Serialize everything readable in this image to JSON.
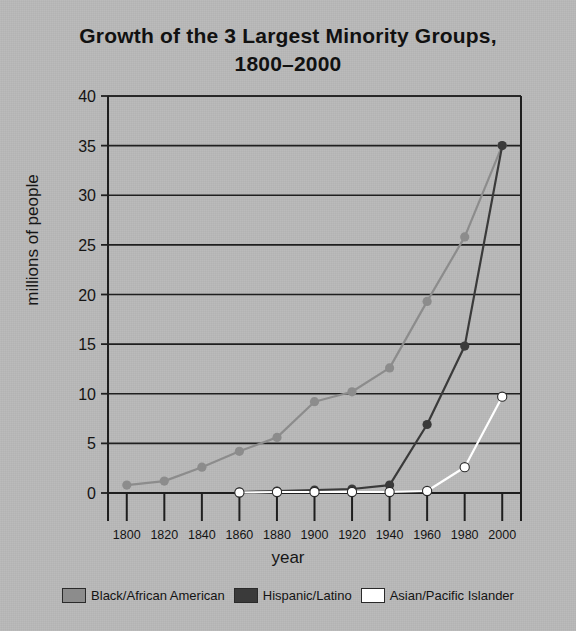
{
  "title": {
    "line1": "Growth of the 3 Largest Minority Groups,",
    "line2": "1800–2000"
  },
  "axes": {
    "xlabel": "year",
    "ylabel": "millions of people"
  },
  "legend": {
    "items": [
      {
        "label": "Black/African American",
        "color": "#8c8c8c"
      },
      {
        "label": "Hispanic/Latino",
        "color": "#3a3a3a"
      },
      {
        "label": "Asian/Pacific Islander",
        "color": "#ffffff"
      }
    ]
  },
  "chart_data": {
    "type": "line",
    "title": "Growth of the 3 Largest Minority Groups, 1800–2000",
    "xlabel": "year",
    "ylabel": "millions of people",
    "x": [
      1800,
      1820,
      1840,
      1860,
      1880,
      1900,
      1920,
      1940,
      1960,
      1980,
      2000
    ],
    "xlim": [
      1790,
      2010
    ],
    "ylim": [
      0,
      40
    ],
    "yticks": [
      0,
      5,
      10,
      15,
      20,
      25,
      30,
      35,
      40
    ],
    "xticks": [
      1800,
      1820,
      1840,
      1860,
      1880,
      1900,
      1920,
      1940,
      1960,
      1980,
      2000
    ],
    "grid": "horizontal",
    "legend_position": "bottom",
    "series": [
      {
        "name": "Black/African American",
        "color": "#8c8c8c",
        "x": [
          1800,
          1820,
          1840,
          1860,
          1880,
          1900,
          1920,
          1940,
          1960,
          1980,
          2000
        ],
        "values": [
          0.8,
          1.2,
          2.6,
          4.2,
          5.6,
          9.2,
          10.2,
          12.6,
          19.3,
          25.8,
          35.0
        ]
      },
      {
        "name": "Hispanic/Latino",
        "color": "#3a3a3a",
        "x": [
          1860,
          1880,
          1900,
          1920,
          1940,
          1960,
          1980,
          2000
        ],
        "values": [
          0.1,
          0.2,
          0.3,
          0.4,
          0.8,
          6.9,
          14.8,
          35.0
        ]
      },
      {
        "name": "Asian/Pacific Islander",
        "color": "#ffffff",
        "x": [
          1860,
          1880,
          1900,
          1920,
          1940,
          1960,
          1980,
          2000
        ],
        "values": [
          0.05,
          0.1,
          0.1,
          0.1,
          0.1,
          0.2,
          2.6,
          9.7
        ]
      }
    ]
  },
  "colors": {
    "background": "#b9b9b9",
    "axis": "#1f1f1f",
    "text": "#141414"
  }
}
